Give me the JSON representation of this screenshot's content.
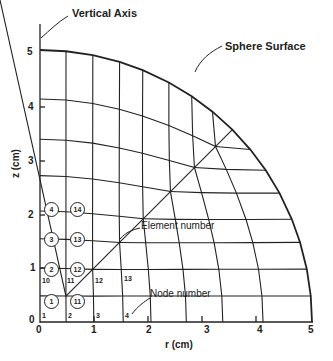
{
  "diagram": {
    "annotations": {
      "vertical_axis": "Vertical Axis",
      "sphere_surface": "Sphere Surface",
      "element_number": "Element number",
      "node_number": "Node number"
    },
    "axes": {
      "x_label": "r (cm)",
      "y_label": "z (cm)",
      "x_ticks": [
        "0",
        "1",
        "2",
        "3",
        "4",
        "5"
      ],
      "y_ticks": [
        "0",
        "1",
        "2",
        "3",
        "4",
        "5"
      ]
    },
    "node_labels": [
      "1",
      "2",
      "3",
      "4",
      "10",
      "11",
      "12",
      "13"
    ],
    "element_labels": [
      "1",
      "2",
      "3",
      "4",
      "11",
      "12",
      "13",
      "14"
    ],
    "colors": {
      "line": "#222222",
      "background": "#ffffff"
    }
  }
}
